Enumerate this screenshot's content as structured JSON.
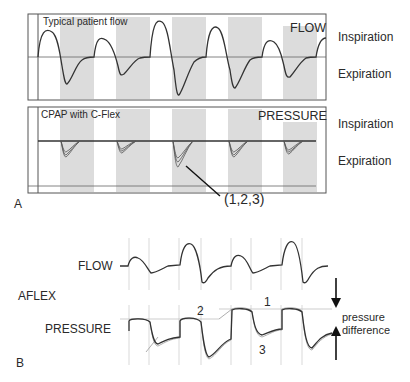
{
  "panel_a": {
    "label": "A",
    "flow_panel": {
      "title": "Typical patient flow",
      "signal_label": "FLOW",
      "side_labels": {
        "top": "Inspiration",
        "bottom": "Expiration"
      }
    },
    "pressure_panel": {
      "title": "CPAP with C-Flex",
      "signal_label": "PRESSURE",
      "side_labels": {
        "top": "Inspiration",
        "bottom": "Expiration"
      },
      "callout": "(1,2,3)"
    }
  },
  "panel_b": {
    "label": "B",
    "mode_label": "AFLEX",
    "flow_label": "FLOW",
    "pressure_label": "PRESSURE",
    "annotations": {
      "n1": "1",
      "n2": "2",
      "n3": "3"
    },
    "pressure_difference_line1": "pressure",
    "pressure_difference_line2": "difference"
  },
  "colors": {
    "shade": "#d9d9d9",
    "trace": "#333333",
    "grid": "#c8c8c8",
    "frame": "#555555"
  }
}
